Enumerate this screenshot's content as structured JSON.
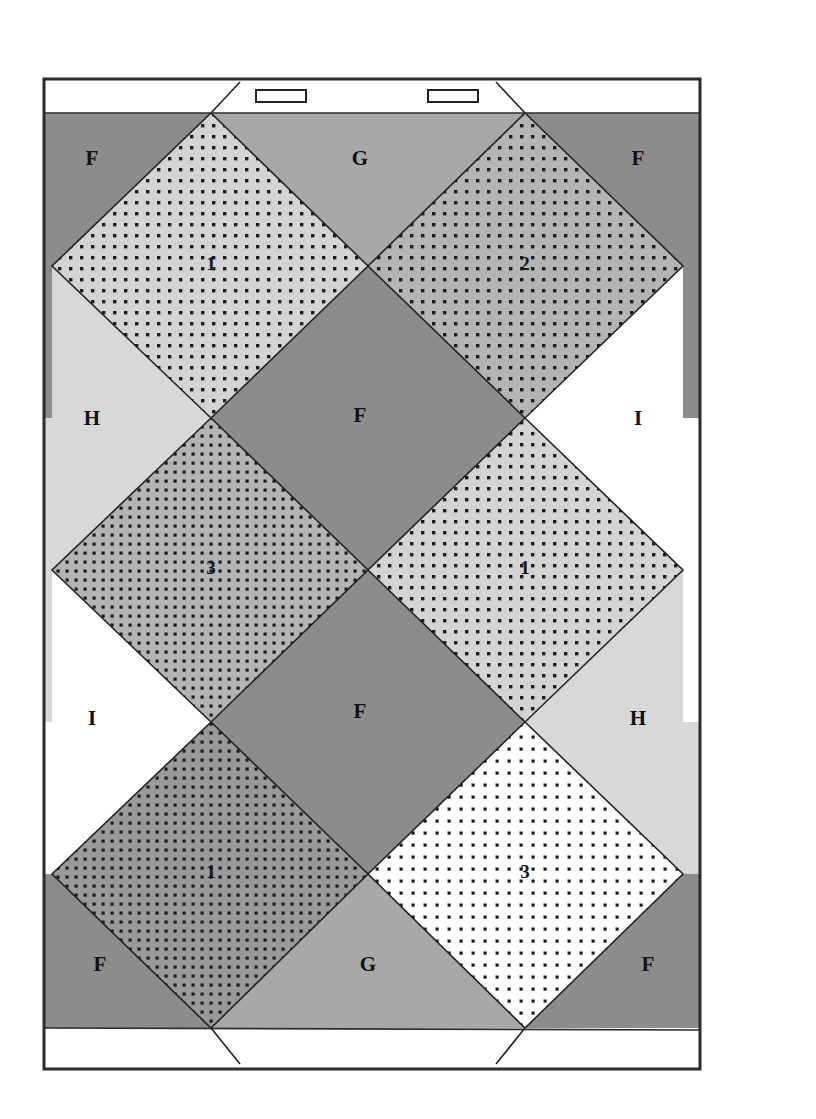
{
  "figure": {
    "background_color": "#ffffff",
    "frame": {
      "stroke_color": "#2b2b2b",
      "fill_color": "#ffffff",
      "x": 44,
      "y": 79,
      "width": 656,
      "height": 990
    },
    "flaps": {
      "top_flap_label": "top-flap",
      "bottom_flap_label": "bottom-flap",
      "top_flap_band_y": 113,
      "bottom_flap_band_y": 1028,
      "notches": [
        {
          "name": "notch-left",
          "x": 256,
          "y": 90,
          "width": 50,
          "height": 12
        },
        {
          "name": "notch-right",
          "x": 428,
          "y": 90,
          "width": 50,
          "height": 12
        }
      ]
    },
    "palette": {
      "dark_gray": "#8c8c8c",
      "mid_gray": "#a8a8a8",
      "light_gray": "#d8d8d8",
      "pale_gray": "#e9e9e9",
      "white": "#fcfcfc",
      "tile_light": "#d4d4d4",
      "tile_mid": "#b4b4b4",
      "tile_dark": "#9a9a9a",
      "tile_white": "#ffffff",
      "dot_color": "#1c1c1c",
      "line_color": "#222222"
    },
    "grid": {
      "left_x": 52,
      "right_x": 683,
      "center_x": 368,
      "row_y": [
        113,
        266,
        417,
        570,
        722,
        874,
        1028
      ],
      "columns": 2,
      "rows": 3
    },
    "background_regions": [
      {
        "name": "bg-top-left",
        "label": "F",
        "shade": "dark_gray",
        "label_x": 92,
        "label_y": 160
      },
      {
        "name": "bg-top-center",
        "label": "G",
        "shade": "mid_gray",
        "label_x": 360,
        "label_y": 160
      },
      {
        "name": "bg-top-right",
        "label": "F",
        "shade": "dark_gray",
        "label_x": 638,
        "label_y": 160
      },
      {
        "name": "bg-mid-left",
        "label": "H",
        "shade": "light_gray",
        "label_x": 92,
        "label_y": 420
      },
      {
        "name": "bg-center-upper",
        "label": "F",
        "shade": "dark_gray",
        "label_x": 360,
        "label_y": 417
      },
      {
        "name": "bg-mid-right",
        "label": "I",
        "shade": "white",
        "label_x": 638,
        "label_y": 420
      },
      {
        "name": "bg-low-left",
        "label": "I",
        "shade": "white",
        "label_x": 92,
        "label_y": 720
      },
      {
        "name": "bg-center-lower",
        "label": "F",
        "shade": "dark_gray",
        "label_x": 360,
        "label_y": 713
      },
      {
        "name": "bg-low-right",
        "label": "H",
        "shade": "light_gray",
        "label_x": 638,
        "label_y": 720
      },
      {
        "name": "bg-bottom-left",
        "label": "F",
        "shade": "dark_gray",
        "label_x": 100,
        "label_y": 966
      },
      {
        "name": "bg-bottom-center",
        "label": "G",
        "shade": "mid_gray",
        "label_x": 368,
        "label_y": 966
      },
      {
        "name": "bg-bottom-right",
        "label": "F",
        "shade": "dark_gray",
        "label_x": 648,
        "label_y": 966
      }
    ],
    "tiles": [
      {
        "name": "tile-r1-c1",
        "label": "1",
        "fill": "tile_light",
        "dot_pattern": "dots-medium",
        "cx": 211,
        "cy": 266
      },
      {
        "name": "tile-r1-c2",
        "label": "2",
        "fill": "tile_mid",
        "dot_pattern": "dots-medium",
        "cx": 525,
        "cy": 266
      },
      {
        "name": "tile-r2-c1",
        "label": "3",
        "fill": "tile_mid",
        "dot_pattern": "dots-dense",
        "cx": 211,
        "cy": 570
      },
      {
        "name": "tile-r2-c2",
        "label": "1",
        "fill": "tile_light",
        "dot_pattern": "dots-medium",
        "cx": 525,
        "cy": 570
      },
      {
        "name": "tile-r3-c1",
        "label": "1",
        "fill": "tile_dark",
        "dot_pattern": "dots-dense",
        "cx": 211,
        "cy": 874
      },
      {
        "name": "tile-r3-c2",
        "label": "3",
        "fill": "tile_white",
        "dot_pattern": "dots-sparse",
        "cx": 525,
        "cy": 874
      }
    ],
    "legend_letters": [
      "F",
      "G",
      "H",
      "I"
    ],
    "tile_numbers": [
      "1",
      "2",
      "3"
    ]
  }
}
